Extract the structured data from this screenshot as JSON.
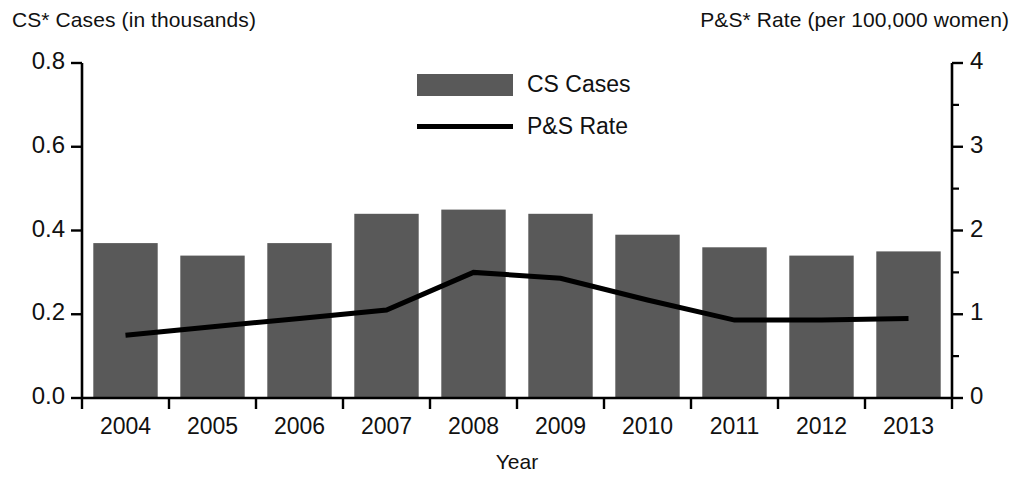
{
  "chart_data": {
    "type": "bar",
    "title": "",
    "subtitle": "",
    "xlabel": "Year",
    "categories": [
      "2004",
      "2005",
      "2006",
      "2007",
      "2008",
      "2009",
      "2010",
      "2011",
      "2012",
      "2013"
    ],
    "grid": false,
    "legend_position": "top-center",
    "axes": {
      "left": {
        "label": "CS* Cases (in thousands)",
        "ticks": [
          "0.0",
          "0.2",
          "0.4",
          "0.6",
          "0.8"
        ],
        "tick_values": [
          0.0,
          0.2,
          0.4,
          0.6,
          0.8
        ],
        "lim": [
          0,
          0.8
        ]
      },
      "right": {
        "label": "P&S* Rate (per 100,000 women)",
        "ticks": [
          "0",
          "1",
          "2",
          "3",
          "4"
        ],
        "tick_values": [
          0,
          1,
          2,
          3,
          4
        ],
        "minor_tick_values": [
          0.5,
          1.5,
          2.5,
          3.5
        ],
        "lim": [
          0,
          4
        ]
      }
    },
    "series": [
      {
        "name": "CS Cases",
        "type": "bar",
        "axis": "left",
        "color": "#595959",
        "values": [
          0.37,
          0.34,
          0.37,
          0.44,
          0.45,
          0.44,
          0.39,
          0.36,
          0.34,
          0.35
        ]
      },
      {
        "name": "P&S Rate",
        "type": "line",
        "axis": "right",
        "color": "#000000",
        "values": [
          0.75,
          0.85,
          0.95,
          1.05,
          1.5,
          1.43,
          1.17,
          0.93,
          0.93,
          0.95
        ]
      }
    ],
    "legend": [
      {
        "label": "CS Cases",
        "marker": "bar-swatch",
        "color": "#595959"
      },
      {
        "label": "P&S Rate",
        "marker": "line-swatch",
        "color": "#000000"
      }
    ]
  }
}
